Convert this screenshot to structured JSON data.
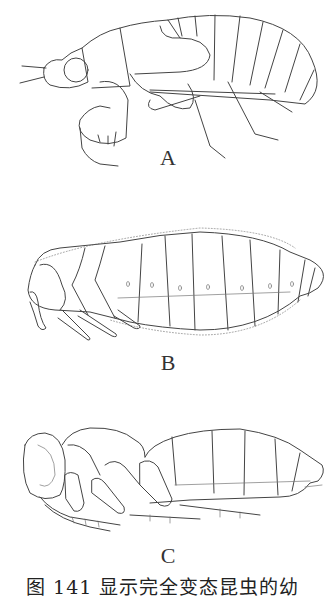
{
  "figures": [
    {
      "id": "A",
      "label": "A",
      "description": "nymph side view with segmented abdomen, jointed legs, antennae"
    },
    {
      "id": "B",
      "label": "B",
      "description": "setose pupa/larva side view, segmented body with spiracles"
    },
    {
      "id": "C",
      "label": "C",
      "description": "exarate pupa side view with folded appendages"
    }
  ],
  "caption": "图 141 显示完全变态昆虫的幼"
}
